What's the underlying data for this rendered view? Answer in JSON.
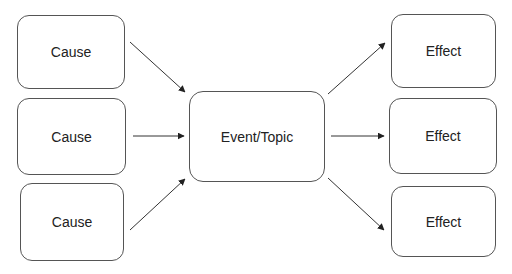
{
  "diagram": {
    "type": "cause-and-effect",
    "center": {
      "label": "Event/Topic"
    },
    "causes": [
      {
        "label": "Cause"
      },
      {
        "label": "Cause"
      },
      {
        "label": "Cause"
      }
    ],
    "effects": [
      {
        "label": "Effect"
      },
      {
        "label": "Effect"
      },
      {
        "label": "Effect"
      }
    ],
    "colors": {
      "stroke": "#555555",
      "arrow": "#222222",
      "text": "#222222",
      "background": "#ffffff"
    }
  }
}
